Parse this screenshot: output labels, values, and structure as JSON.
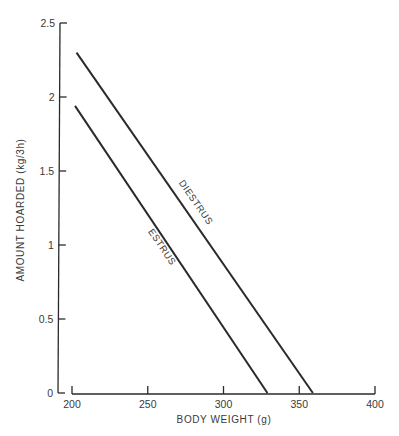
{
  "chart_data": {
    "type": "line",
    "title": "",
    "xlabel": "BODY WEIGHT (g)",
    "ylabel": "AMOUNT HOARDED (kg/3h)",
    "xlim": [
      200,
      400
    ],
    "ylim": [
      0,
      2.5
    ],
    "x_ticks": [
      200,
      250,
      300,
      350,
      400
    ],
    "x_tick_labels": [
      "200",
      "250",
      "300",
      "350",
      "400"
    ],
    "y_ticks": [
      0,
      0.5,
      1,
      1.5,
      2,
      2.5
    ],
    "y_tick_labels": [
      "0",
      "0.5",
      "1",
      "1.5",
      "2",
      "2.5"
    ],
    "grid": false,
    "legend": "inline labels along lines",
    "series": [
      {
        "name": "DIESTRUS",
        "x": [
          203,
          359
        ],
        "y": [
          2.3,
          0
        ]
      },
      {
        "name": "ESTRUS",
        "x": [
          202,
          329
        ],
        "y": [
          1.94,
          0
        ]
      }
    ]
  },
  "colors": {
    "line": "#2a2a2a",
    "text": "#3a3a3a",
    "background": "#ffffff"
  }
}
